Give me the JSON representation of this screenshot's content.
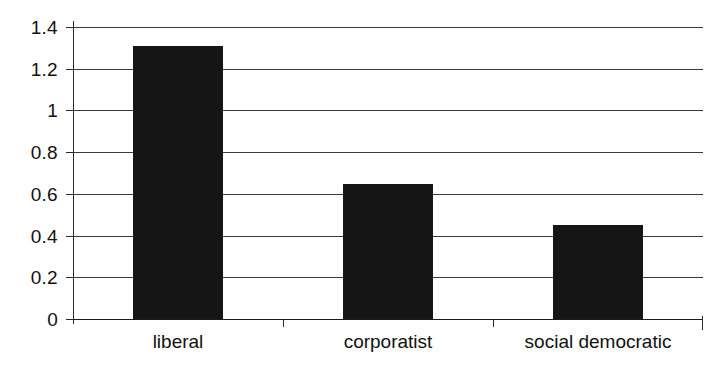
{
  "chart_data": {
    "type": "bar",
    "title": "",
    "subtitle": "",
    "xlabel": "",
    "ylabel": "",
    "categories": [
      "liberal",
      "corporatist",
      "social democratic"
    ],
    "values": [
      1.31,
      0.645,
      0.45
    ],
    "series": [
      {
        "name": "",
        "values": [
          1.31,
          0.645,
          0.45
        ]
      }
    ],
    "ylim": [
      0,
      1.4
    ],
    "ytick_labels": [
      "0",
      "0.2",
      "0.4",
      "0.6",
      "0.8",
      "1",
      "1.2",
      "1.4"
    ],
    "ytick_values": [
      0,
      0.2,
      0.4,
      0.6,
      0.8,
      1,
      1.2,
      1.4
    ],
    "grid": true,
    "legend": false,
    "legend_position": "none",
    "annotations": [],
    "bar_color": "#151515",
    "grid_color": "#3a3a3a",
    "axis_color": "#1a1a1a",
    "background_color": "#ffffff"
  }
}
